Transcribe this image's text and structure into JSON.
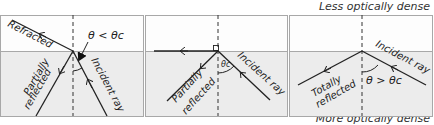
{
  "media": {
    "top_label": "Less optically dense",
    "bottom_label": "More optically dense"
  },
  "colors": {
    "upper_medium": "#fdfdfd",
    "lower_medium": "#ececec",
    "border": "#a8a8a8",
    "ray": "#222222"
  },
  "panels": [
    {
      "name": "below-critical-angle",
      "condition": "θ < θc",
      "labels": {
        "incident": "Incident ray",
        "reflected_line1": "Partially",
        "reflected_line2": "reflected",
        "refracted": "Refracted"
      }
    },
    {
      "name": "at-critical-angle",
      "condition": "θc",
      "labels": {
        "incident": "Incident ray",
        "reflected_line1": "Partially",
        "reflected_line2": "reflected"
      }
    },
    {
      "name": "above-critical-angle",
      "condition": "θ > θc",
      "labels": {
        "incident": "Incident ray",
        "reflected_line1": "Totally",
        "reflected_line2": "reflected"
      }
    }
  ]
}
